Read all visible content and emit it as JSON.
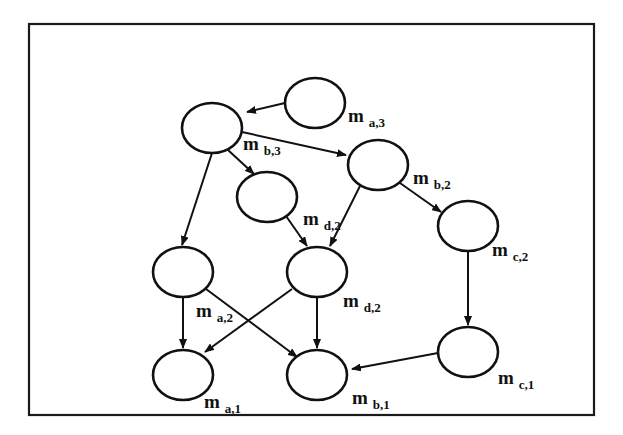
{
  "diagram": {
    "type": "directed-graph",
    "frame": {
      "x": 29,
      "y": 24,
      "width": 565,
      "height": 391
    },
    "nodes": [
      {
        "id": "a3",
        "cx": 315,
        "cy": 103,
        "label_main": "m",
        "label_sub": "a,3",
        "lx": 348,
        "ly": 122
      },
      {
        "id": "b3",
        "cx": 212,
        "cy": 128,
        "label_main": "m",
        "label_sub": "b,3",
        "lx": 243,
        "ly": 150
      },
      {
        "id": "b2",
        "cx": 378,
        "cy": 165,
        "label_main": "m",
        "label_sub": "b,2",
        "lx": 413,
        "ly": 184
      },
      {
        "id": "d2u",
        "cx": 267,
        "cy": 197,
        "label_main": "m",
        "label_sub": "d,2",
        "lx": 303,
        "ly": 225
      },
      {
        "id": "c2",
        "cx": 468,
        "cy": 226,
        "label_main": "m",
        "label_sub": "c,2",
        "lx": 492,
        "ly": 256
      },
      {
        "id": "a2",
        "cx": 183,
        "cy": 272,
        "label_main": "m",
        "label_sub": "a,2",
        "lx": 196,
        "ly": 317
      },
      {
        "id": "d2l",
        "cx": 317,
        "cy": 272,
        "label_main": "m",
        "label_sub": "d,2",
        "lx": 343,
        "ly": 307
      },
      {
        "id": "c1",
        "cx": 468,
        "cy": 352,
        "label_main": "m",
        "label_sub": "c,1",
        "lx": 498,
        "ly": 384
      },
      {
        "id": "a1",
        "cx": 183,
        "cy": 375,
        "label_main": "m",
        "label_sub": "a,1",
        "lx": 204,
        "ly": 408
      },
      {
        "id": "b1",
        "cx": 317,
        "cy": 375,
        "label_main": "m",
        "label_sub": "b,1",
        "lx": 352,
        "ly": 404
      }
    ],
    "edges": [
      {
        "from": "a3",
        "to": "b3",
        "x1": 285,
        "y1": 103,
        "x2": 247,
        "y2": 112
      },
      {
        "from": "b3",
        "to": "b2",
        "x1": 242,
        "y1": 132,
        "x2": 346,
        "y2": 155
      },
      {
        "from": "b3",
        "to": "d2u",
        "x1": 228,
        "y1": 150,
        "x2": 254,
        "y2": 174
      },
      {
        "from": "b3",
        "to": "a2",
        "x1": 212,
        "y1": 153,
        "x2": 182,
        "y2": 245
      },
      {
        "from": "b2",
        "to": "c2",
        "x1": 400,
        "y1": 183,
        "x2": 441,
        "y2": 212
      },
      {
        "from": "b2",
        "to": "d2l",
        "x1": 360,
        "y1": 186,
        "x2": 330,
        "y2": 246
      },
      {
        "from": "d2u",
        "to": "d2l",
        "x1": 286,
        "y1": 216,
        "x2": 307,
        "y2": 246
      },
      {
        "from": "c2",
        "to": "c1",
        "x1": 468,
        "y1": 251,
        "x2": 468,
        "y2": 325
      },
      {
        "from": "a2",
        "to": "a1",
        "x1": 183,
        "y1": 297,
        "x2": 183,
        "y2": 348
      },
      {
        "from": "a2",
        "to": "b1",
        "x1": 206,
        "y1": 289,
        "x2": 297,
        "y2": 357
      },
      {
        "from": "d2l",
        "to": "a1",
        "x1": 292,
        "y1": 289,
        "x2": 205,
        "y2": 352
      },
      {
        "from": "d2l",
        "to": "b1",
        "x1": 317,
        "y1": 297,
        "x2": 317,
        "y2": 348
      },
      {
        "from": "c1",
        "to": "b1",
        "x1": 438,
        "y1": 353,
        "x2": 352,
        "y2": 369
      }
    ]
  }
}
